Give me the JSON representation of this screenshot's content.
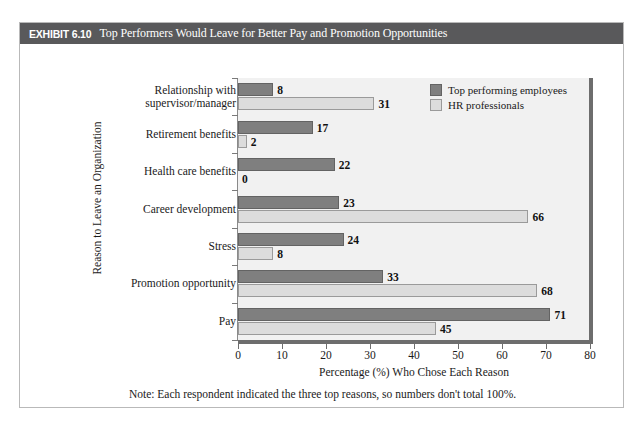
{
  "exhibit": {
    "number": "EXHIBIT 6.10",
    "title": "Top Performers Would Leave for Better Pay and Promotion Opportunities",
    "header_bg": "#59595b",
    "header_text_color": "#ffffff"
  },
  "note": "Note: Each respondent indicated the three top reasons, so numbers don't total 100%.",
  "legend": {
    "position": "top-right",
    "items": [
      {
        "label": "Top performing employees",
        "color": "#7f7f7f"
      },
      {
        "label": "HR professionals",
        "color": "#dcdcdc"
      }
    ]
  },
  "chart_data": {
    "type": "bar",
    "orientation": "horizontal",
    "title": "Top Performers Would Leave for Better Pay and Promotion Opportunities",
    "xlabel": "Percentage (%) Who Chose Each Reason",
    "ylabel": "Reason to Leave an Organization",
    "xlim": [
      0,
      80
    ],
    "xticks": [
      0,
      10,
      20,
      30,
      40,
      50,
      60,
      70,
      80
    ],
    "grid": false,
    "legend_position": "top-right",
    "plot_background": "#f1f1f1",
    "categories": [
      "Relationship with supervisor/manager",
      "Retirement benefits",
      "Health care benefits",
      "Career development",
      "Stress",
      "Promotion opportunity",
      "Pay"
    ],
    "category_lines": [
      [
        "Relationship with",
        "supervisor/manager"
      ],
      [
        "Retirement benefits"
      ],
      [
        "Health care benefits"
      ],
      [
        "Career development"
      ],
      [
        "Stress"
      ],
      [
        "Promotion opportunity"
      ],
      [
        "Pay"
      ]
    ],
    "series": [
      {
        "name": "Top performing employees",
        "color": "#7f7f7f",
        "values": [
          8,
          17,
          22,
          23,
          24,
          33,
          71
        ]
      },
      {
        "name": "HR professionals",
        "color": "#dcdcdc",
        "values": [
          31,
          2,
          0,
          66,
          8,
          68,
          45
        ]
      }
    ]
  }
}
